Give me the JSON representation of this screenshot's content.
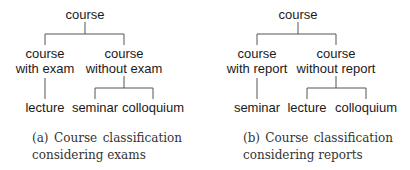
{
  "figures": [
    {
      "id": "a",
      "root": "course",
      "children": [
        {
          "label_line1": "course",
          "label_line2": "with exam",
          "leaves": [
            "lecture"
          ]
        },
        {
          "label_line1": "course",
          "label_line2": "without exam",
          "leaves": [
            "seminar",
            "colloquium"
          ]
        }
      ],
      "caption": {
        "tag": "(a)",
        "w1": "Course",
        "w2": "classification",
        "line2": "considering exams"
      }
    },
    {
      "id": "b",
      "root": "course",
      "children": [
        {
          "label_line1": "course",
          "label_line2": "with report",
          "leaves": [
            "seminar"
          ]
        },
        {
          "label_line1": "course",
          "label_line2": "without report",
          "leaves": [
            "lecture",
            "colloquium"
          ]
        }
      ],
      "caption": {
        "tag": "(b)",
        "w1": "Course",
        "w2": "classification",
        "line2": "considering reports"
      }
    }
  ],
  "colors": {
    "line": "#555555",
    "text": "#1a1a1a"
  }
}
